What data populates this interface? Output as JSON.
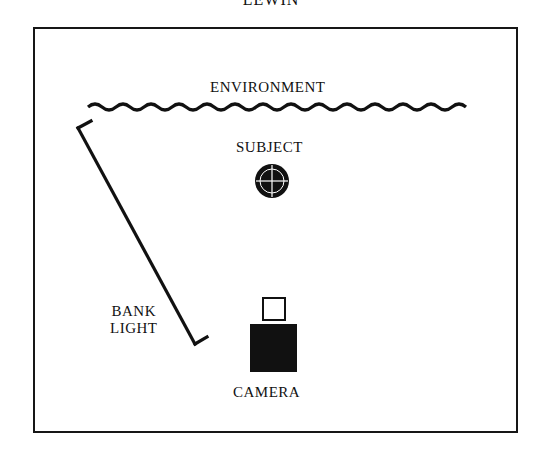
{
  "header": {
    "text": "LEWIN"
  },
  "diagram": {
    "labels": {
      "environment": "ENVIRONMENT",
      "subject": "SUBJECT",
      "bank_light_line1": "BANK",
      "bank_light_line2": "LIGHT",
      "camera": "CAMERA"
    },
    "colors": {
      "ink": "#111111",
      "background": "#ffffff"
    }
  }
}
